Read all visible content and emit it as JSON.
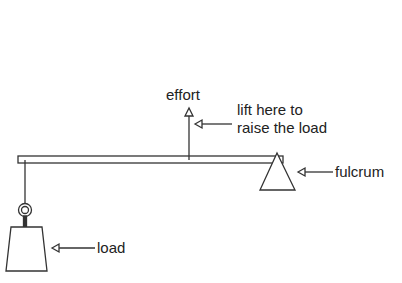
{
  "diagram": {
    "labels": {
      "effort": "effort",
      "hint_line1": "lift here to",
      "hint_line2": "raise the load",
      "fulcrum": "fulcrum",
      "load": "load"
    },
    "colors": {
      "stroke": "#333333",
      "text": "#222222",
      "background": "#ffffff"
    }
  }
}
